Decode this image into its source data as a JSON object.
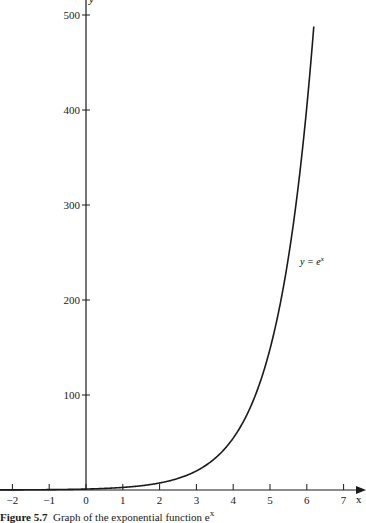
{
  "chart_data": {
    "type": "line",
    "title": "",
    "xlabel": "x",
    "ylabel": "y",
    "xlim": [
      -2.3,
      7.5
    ],
    "ylim": [
      0,
      520
    ],
    "x_ticks": [
      -2,
      -1,
      0,
      1,
      2,
      3,
      4,
      5,
      6,
      7
    ],
    "x_tick_labels": [
      "−2",
      "−1",
      "0",
      "1",
      "2",
      "3",
      "4",
      "5",
      "6",
      "7"
    ],
    "y_ticks": [
      100,
      200,
      300,
      400,
      500
    ],
    "y_tick_labels": [
      "100",
      "200",
      "300",
      "400",
      "500"
    ],
    "grid": false,
    "series": [
      {
        "name": "y = e^x",
        "function": "exp(x)",
        "x": [
          -2.3,
          -2,
          -1,
          0,
          1,
          2,
          3,
          4,
          5,
          6,
          6.2
        ],
        "values": [
          0.1,
          0.14,
          0.37,
          1,
          2.72,
          7.39,
          20.09,
          54.6,
          148.4,
          403.4,
          492.7
        ]
      }
    ],
    "annotations": [
      {
        "text": "y = e",
        "superscript": "x",
        "x": 5.8,
        "y": 240
      }
    ]
  },
  "labels": {
    "x_axis": "x",
    "y_axis": "y",
    "curve": "y = e",
    "curve_sup": "x",
    "caption_prefix": "Figure 5.7",
    "caption_text": "Graph of the exponential function e",
    "caption_sup": "x"
  }
}
